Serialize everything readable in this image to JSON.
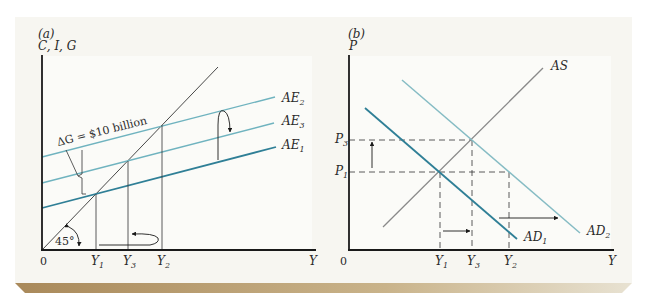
{
  "figure": {
    "panel_a": {
      "label": "(a)",
      "y_axis_label": "C, I, G",
      "x_axis_label": "Y",
      "origin_label": "0",
      "angle_label": "45°",
      "delta_label": "ΔG = $10 billion",
      "curves": [
        {
          "id": "AE2",
          "label": "AE",
          "sub": "2"
        },
        {
          "id": "AE3",
          "label": "AE",
          "sub": "3"
        },
        {
          "id": "AE1",
          "label": "AE",
          "sub": "1"
        }
      ],
      "x_ticks": [
        {
          "label": "Y",
          "sub": "1"
        },
        {
          "label": "Y",
          "sub": "3"
        },
        {
          "label": "Y",
          "sub": "2"
        }
      ]
    },
    "panel_b": {
      "label": "(b)",
      "y_axis_label": "P",
      "x_axis_label": "Y",
      "origin_label": "0",
      "curves": [
        {
          "id": "AS",
          "label": "AS",
          "sub": ""
        },
        {
          "id": "AD1",
          "label": "AD",
          "sub": "1"
        },
        {
          "id": "AD2",
          "label": "AD",
          "sub": "2"
        }
      ],
      "y_ticks": [
        {
          "label": "P",
          "sub": "3"
        },
        {
          "label": "P",
          "sub": "1"
        }
      ],
      "x_ticks": [
        {
          "label": "Y",
          "sub": "1"
        },
        {
          "label": "Y",
          "sub": "3"
        },
        {
          "label": "Y",
          "sub": "2"
        }
      ]
    }
  },
  "colors": {
    "card_bg": "#f7f6f1",
    "plot_bg": "#fbfbf8",
    "axis": "#1a1a1a",
    "ae_dark": "#2f7f96",
    "ae_light": "#6fb3bf",
    "ad2_light": "#86bcc4",
    "as_gray": "#8a8a8a",
    "shadow": "#b89a62"
  }
}
